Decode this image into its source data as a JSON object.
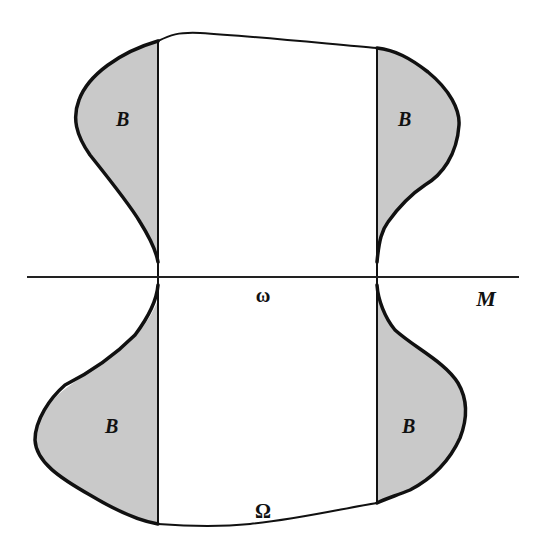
{
  "diagram": {
    "colors": {
      "background": "#ffffff",
      "shaded_fill": "#c9c9c9",
      "stroke": "#111111"
    },
    "labels": {
      "region_top_left": "B",
      "region_top_right": "B",
      "region_bottom_left": "B",
      "region_bottom_right": "B",
      "submanifold": "ω",
      "domain": "Ω",
      "line": "M"
    }
  }
}
